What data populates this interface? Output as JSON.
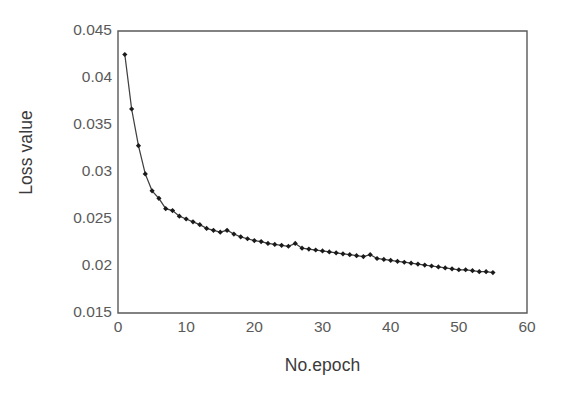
{
  "chart_data": {
    "type": "line",
    "title": "",
    "xlabel": "No.epoch",
    "ylabel": "Loss value",
    "xlim": [
      0,
      60
    ],
    "ylim": [
      0.015,
      0.045
    ],
    "xticks": [
      "0",
      "10",
      "20",
      "30",
      "40",
      "50",
      "60"
    ],
    "xtick_values": [
      0,
      10,
      20,
      30,
      40,
      50,
      60
    ],
    "yticks": [
      "0.015",
      "0.02",
      "0.025",
      "0.03",
      "0.035",
      "0.04",
      "0.045"
    ],
    "ytick_values": [
      0.015,
      0.02,
      0.025,
      0.03,
      0.035,
      0.04,
      0.045
    ],
    "grid": false,
    "legend": "none",
    "marker": "diamond",
    "line_color": "#3f3f3f",
    "marker_color": "#1a1a1a",
    "axis_color": "#595959",
    "background": "#ffffff",
    "series": [
      {
        "name": "Loss value",
        "x": [
          1,
          2,
          3,
          4,
          5,
          6,
          7,
          8,
          9,
          10,
          11,
          12,
          13,
          14,
          15,
          16,
          17,
          18,
          19,
          20,
          21,
          22,
          23,
          24,
          25,
          26,
          27,
          28,
          29,
          30,
          31,
          32,
          33,
          34,
          35,
          36,
          37,
          38,
          39,
          40,
          41,
          42,
          43,
          44,
          45,
          46,
          47,
          48,
          49,
          50,
          51,
          52,
          53,
          54,
          55
        ],
        "values": [
          0.0425,
          0.0367,
          0.0328,
          0.0298,
          0.028,
          0.0272,
          0.0261,
          0.0259,
          0.0253,
          0.025,
          0.0247,
          0.0244,
          0.024,
          0.0238,
          0.0236,
          0.0238,
          0.0234,
          0.0231,
          0.0229,
          0.0227,
          0.0226,
          0.0224,
          0.0223,
          0.0222,
          0.0221,
          0.0224,
          0.0219,
          0.0218,
          0.0217,
          0.0216,
          0.0215,
          0.0214,
          0.0213,
          0.0212,
          0.0211,
          0.021,
          0.0212,
          0.0208,
          0.0207,
          0.0206,
          0.0205,
          0.0204,
          0.0203,
          0.0202,
          0.0201,
          0.02,
          0.0199,
          0.0198,
          0.0197,
          0.0196,
          0.0196,
          0.0195,
          0.0194,
          0.0194,
          0.0193
        ]
      }
    ]
  }
}
